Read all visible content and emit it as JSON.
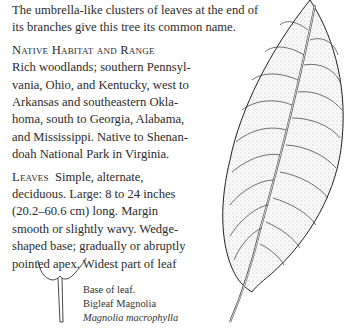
{
  "intro": {
    "lines": [
      "The umbrella-like clusters of leaves at the end of",
      "its branches give this tree its common name."
    ]
  },
  "habitat": {
    "heading": "Native Habitat and Range",
    "lines": [
      "Rich woodlands; southern Pennsyl-",
      "vania, Ohio, and Kentucky, west to",
      "Arkansas and southeastern Okla-",
      "homa, south to Georgia, Alabama,",
      "and Mississippi. Native to Shenan-",
      "doah National Park in Virginia."
    ]
  },
  "leaves": {
    "heading": "Leaves",
    "lines": [
      "Simple, alternate,",
      "deciduous. Large: 8 to 24 inches",
      "(20.2–60.6 cm) long. Margin",
      "smooth or slightly wavy. Wedge-",
      "shaped base; gradually or abruptly",
      "pointed apex. Widest part of leaf"
    ]
  },
  "caption": {
    "line1": "Base of leaf.",
    "line2": "Bigleaf Magnolia",
    "line3": "Magnolia macrophylla"
  },
  "illustrations": {
    "leaf": "magnolia-leaf-illustration",
    "base": "leaf-base-illustration"
  }
}
